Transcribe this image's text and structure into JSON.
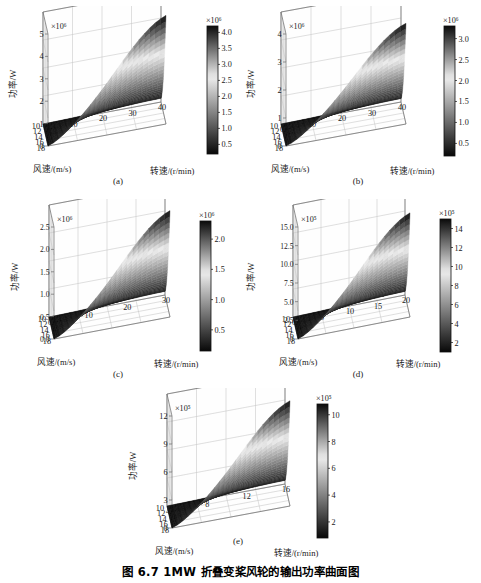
{
  "figure": {
    "caption": "图 6.7    1MW 折叠变桨风轮的输出功率曲面图",
    "zlabel": "功率/W",
    "xlabel": "转速/(r/min)",
    "ylabel": "风速/(m/s)",
    "colormap": "grayscale-dark-light-dark"
  },
  "panels": [
    {
      "id": "a",
      "sublabel": "(a)",
      "chart_data": {
        "type": "surface",
        "title": "",
        "zlabel": "功率/W",
        "xlabel": "转速/(r/min)",
        "ylabel": "风速/(m/s)",
        "z_exponent": "×10⁶",
        "z_ticks": [
          0,
          1,
          2,
          3,
          4,
          5
        ],
        "zlim": [
          0,
          5
        ],
        "x_ticks": [
          10,
          20,
          30,
          40
        ],
        "xlim": [
          0,
          40
        ],
        "y_ticks": [
          18,
          16,
          14,
          12,
          10
        ],
        "ylim": [
          10,
          18
        ],
        "colorbar": {
          "exponent": "×10⁶",
          "ticks": [
            0.5,
            1.0,
            1.5,
            2.0,
            2.5,
            3.0,
            3.5,
            4.0
          ],
          "range": [
            0.2,
            4.2
          ]
        },
        "peak_value": 4600000.0,
        "grid": true
      }
    },
    {
      "id": "b",
      "sublabel": "(b)",
      "chart_data": {
        "type": "surface",
        "title": "",
        "zlabel": "功率/W",
        "xlabel": "转速/(r/min)",
        "ylabel": "风速/(m/s)",
        "z_exponent": "×10⁶",
        "z_ticks": [
          0,
          1,
          2,
          3,
          4
        ],
        "zlim": [
          0,
          4
        ],
        "x_ticks": [
          0,
          10,
          20,
          30,
          40
        ],
        "xlim": [
          0,
          40
        ],
        "y_ticks": [
          18,
          16,
          14,
          12,
          10
        ],
        "ylim": [
          10,
          18
        ],
        "colorbar": {
          "exponent": "×10⁶",
          "ticks": [
            0.5,
            1.0,
            1.5,
            2.0,
            2.5,
            3.0
          ],
          "range": [
            0.2,
            3.3
          ]
        },
        "peak_value": 3600000.0,
        "grid": true
      }
    },
    {
      "id": "c",
      "sublabel": "(c)",
      "chart_data": {
        "type": "surface",
        "title": "",
        "zlabel": "功率/W",
        "xlabel": "转速/(r/min)",
        "ylabel": "风速/(m/s)",
        "z_exponent": "×10⁶",
        "z_ticks": [
          0,
          0.5,
          1.0,
          1.5,
          2.0,
          2.5
        ],
        "zlim": [
          0,
          2.5
        ],
        "x_ticks": [
          0,
          10,
          20,
          30
        ],
        "xlim": [
          0,
          30
        ],
        "y_ticks": [
          18,
          16,
          14,
          12,
          10
        ],
        "ylim": [
          10,
          18
        ],
        "colorbar": {
          "exponent": "×10⁶",
          "ticks": [
            0.5,
            1.0,
            1.5,
            2.0
          ],
          "range": [
            0.15,
            2.3
          ]
        },
        "peak_value": 2400000.0,
        "grid": true
      }
    },
    {
      "id": "d",
      "sublabel": "(d)",
      "chart_data": {
        "type": "surface",
        "title": "",
        "zlabel": "功率/W",
        "xlabel": "转速/(r/min)",
        "ylabel": "风速/(m/s)",
        "z_exponent": "×10⁵",
        "z_ticks": [
          0,
          2.5,
          5.0,
          7.5,
          10.0,
          12.5,
          15.0
        ],
        "zlim": [
          0,
          15
        ],
        "x_ticks": [
          0,
          5,
          10,
          15,
          20
        ],
        "xlim": [
          0,
          20
        ],
        "y_ticks": [
          18,
          16,
          14,
          12,
          10
        ],
        "ylim": [
          10,
          18
        ],
        "colorbar": {
          "exponent": "×10⁵",
          "ticks": [
            2,
            4,
            6,
            8,
            10,
            12,
            14
          ],
          "range": [
            1,
            15
          ]
        },
        "peak_value": 1450000.0,
        "grid": true
      }
    },
    {
      "id": "e",
      "sublabel": "(e)",
      "chart_data": {
        "type": "surface",
        "title": "",
        "zlabel": "功率/W",
        "xlabel": "转速/(r/min)",
        "ylabel": "风速/(m/s)",
        "z_exponent": "×10⁵",
        "z_ticks": [
          0,
          3,
          6,
          9,
          12
        ],
        "zlim": [
          0,
          12
        ],
        "x_ticks": [
          4,
          8,
          12,
          16
        ],
        "xlim": [
          4,
          16
        ],
        "y_ticks": [
          18,
          16,
          14,
          12,
          10
        ],
        "ylim": [
          10,
          18
        ],
        "colorbar": {
          "exponent": "×10⁵",
          "ticks": [
            2,
            4,
            6,
            8,
            10
          ],
          "range": [
            0.8,
            10.8
          ]
        },
        "peak_value": 1150000.0,
        "grid": true
      }
    }
  ]
}
